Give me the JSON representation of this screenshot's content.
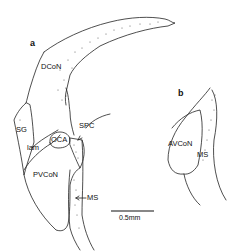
{
  "figure": {
    "panels": [
      {
        "id": "a",
        "label": "a",
        "regions": {
          "dcon": "DCoN",
          "sg": "SG",
          "lam": "lam",
          "oca": "OCA",
          "spc": "SPC",
          "pvcon": "PVCoN",
          "ms": "MS"
        }
      },
      {
        "id": "b",
        "label": "b",
        "regions": {
          "avcon": "AVCoN",
          "ms": "MS"
        }
      }
    ],
    "scale_bar": {
      "label": "0.5mm"
    }
  }
}
